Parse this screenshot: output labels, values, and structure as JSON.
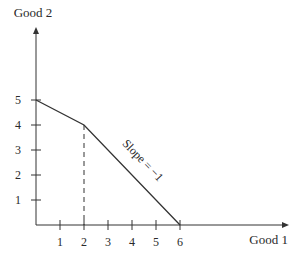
{
  "chart_data": {
    "type": "line",
    "title": "",
    "xlabel": "Good 1",
    "ylabel": "Good 2",
    "xlim": [
      0,
      9.5
    ],
    "ylim": [
      0,
      8
    ],
    "xticks": [
      1,
      2,
      3,
      4,
      5,
      6
    ],
    "xtick_labels": [
      "1",
      "2",
      "3",
      "4",
      "5",
      "6"
    ],
    "yticks": [
      1,
      2,
      3,
      4,
      5
    ],
    "ytick_labels": [
      "1",
      "2",
      "3",
      "4",
      "5"
    ],
    "grid": false,
    "series": [
      {
        "name": "budget-constraint",
        "style": "solid",
        "points": [
          [
            0,
            5
          ],
          [
            2,
            4
          ],
          [
            6,
            0
          ]
        ]
      },
      {
        "name": "kink-reference",
        "style": "dashed",
        "points": [
          [
            2,
            4
          ],
          [
            2,
            0
          ]
        ]
      }
    ],
    "annotations": [
      {
        "text": "Slope = −1",
        "segment": "from (2,4) to (6,0)",
        "placement": "above line, rotated along it"
      }
    ]
  },
  "colors": {
    "line": "#333333",
    "text": "#2a2a2a"
  }
}
